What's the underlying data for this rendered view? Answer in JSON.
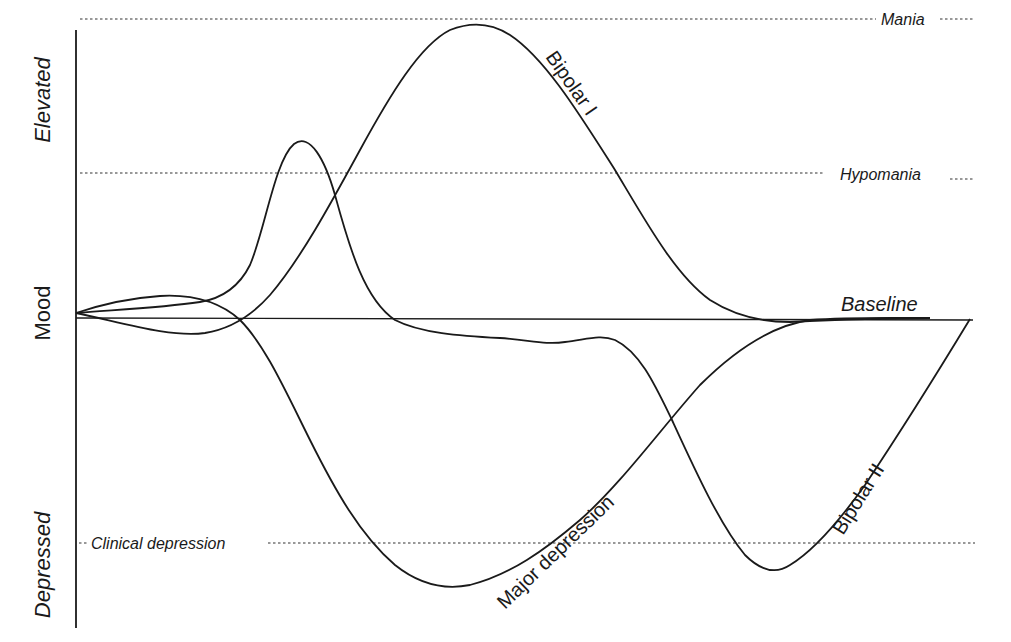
{
  "diagram": {
    "y_axis": {
      "label_top": "Elevated",
      "label_middle": "Mood",
      "label_bottom": "Depressed"
    },
    "reference_levels": [
      {
        "id": "mania",
        "label": "Mania"
      },
      {
        "id": "hypomania",
        "label": "Hypomania"
      },
      {
        "id": "baseline",
        "label": "Baseline"
      },
      {
        "id": "clinical_depression",
        "label": "Clinical depression"
      }
    ],
    "curves": [
      {
        "id": "bipolar_1",
        "label": "Bipolar I",
        "description": "Large elevation reaching mania, returns to baseline"
      },
      {
        "id": "bipolar_2",
        "label": "Bipolar II",
        "description": "Hypomanic peak followed by clinical depression, returns to baseline"
      },
      {
        "id": "major_depression",
        "label": "Major depression",
        "description": "Drop below clinical depression level, returns to baseline"
      }
    ],
    "colors": {
      "line": "#1a1a1a",
      "background": "#ffffff"
    }
  }
}
